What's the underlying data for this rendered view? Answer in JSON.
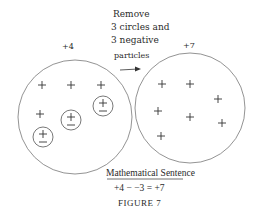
{
  "figure": {
    "left_set": {
      "label": "+4",
      "plus_positions": [
        [
          42,
          85
        ],
        [
          71,
          85
        ],
        [
          101,
          85
        ],
        [
          40,
          114
        ]
      ],
      "circled_pairs": [
        [
          103,
          106
        ],
        [
          71,
          120
        ],
        [
          43,
          137
        ]
      ]
    },
    "right_set": {
      "label": "+7",
      "plus_positions": [
        [
          162,
          84
        ],
        [
          190,
          84
        ],
        [
          218,
          99
        ],
        [
          158,
          111
        ],
        [
          190,
          117
        ],
        [
          222,
          123
        ],
        [
          161,
          136
        ]
      ]
    },
    "instruction": {
      "line1": "Remove",
      "line2": "3 circles and",
      "line3": "3 negative",
      "line4": "particles"
    },
    "sentence_title": "Mathematical Sentence",
    "sentence": "+4 − −3 = +7",
    "caption": "FIGURE 7",
    "colors": {
      "ink": "#2a2a2a",
      "line": "#777777",
      "paper": "#ffffff"
    }
  }
}
